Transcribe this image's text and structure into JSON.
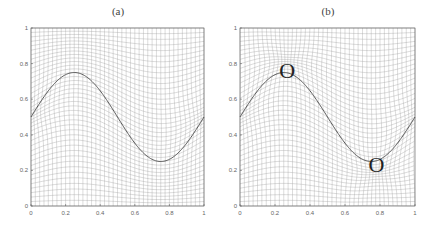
{
  "figure": {
    "panels": [
      {
        "id": "a",
        "title": "(a)"
      },
      {
        "id": "b",
        "title": "(b)"
      }
    ]
  },
  "chart_data": [
    {
      "type": "line",
      "title": "(a)",
      "description": "Adaptive mesh (deformed grid lines) with sine interface curve; mesh concentrated near (0,0.5) and (1,0.5)",
      "xlabel": "",
      "ylabel": "",
      "xlim": [
        0,
        1
      ],
      "ylim": [
        0,
        1
      ],
      "xticks": [
        "0",
        "0.2",
        "0.4",
        "0.6",
        "0.8",
        "1"
      ],
      "yticks": [
        "0",
        "0.2",
        "0.4",
        "0.6",
        "0.8",
        "1"
      ],
      "grid": false,
      "series": [
        {
          "name": "interface curve",
          "x": [
            0,
            0.1,
            0.2,
            0.25,
            0.3,
            0.4,
            0.5,
            0.6,
            0.7,
            0.75,
            0.8,
            0.9,
            1.0
          ],
          "y": [
            0.5,
            0.647,
            0.738,
            0.75,
            0.738,
            0.647,
            0.5,
            0.353,
            0.262,
            0.25,
            0.262,
            0.353,
            0.5
          ]
        }
      ],
      "mesh": {
        "lines": 40,
        "concentration_points": [
          [
            0,
            0.5
          ],
          [
            1,
            0.5
          ]
        ]
      },
      "annotations": []
    },
    {
      "type": "line",
      "title": "(b)",
      "description": "Adaptive mesh with sine interface curve; mesh concentrated near the curve extrema and at (0,0.5),(1,0.5)",
      "xlabel": "",
      "ylabel": "",
      "xlim": [
        0,
        1
      ],
      "ylim": [
        0,
        1
      ],
      "xticks": [
        "0",
        "0.2",
        "0.4",
        "0.6",
        "0.8",
        "1"
      ],
      "yticks": [
        "0",
        "0.2",
        "0.4",
        "0.6",
        "0.8",
        "1"
      ],
      "grid": false,
      "series": [
        {
          "name": "interface curve",
          "x": [
            0,
            0.1,
            0.2,
            0.25,
            0.3,
            0.4,
            0.5,
            0.6,
            0.7,
            0.75,
            0.8,
            0.9,
            1.0
          ],
          "y": [
            0.5,
            0.647,
            0.738,
            0.75,
            0.738,
            0.647,
            0.5,
            0.353,
            0.262,
            0.25,
            0.262,
            0.353,
            0.5
          ]
        }
      ],
      "mesh": {
        "lines": 40,
        "concentration_points": [
          [
            0.27,
            0.75
          ],
          [
            0.78,
            0.25
          ],
          [
            0,
            0.5
          ],
          [
            1,
            0.5
          ]
        ]
      },
      "annotations": [
        {
          "text": "O",
          "x": 0.27,
          "y": 0.76
        },
        {
          "text": "O",
          "x": 0.78,
          "y": 0.23
        }
      ]
    }
  ],
  "layout": {
    "panels": [
      {
        "left": 31,
        "right": 204,
        "top": 28,
        "bottom": 206,
        "title_x": 118,
        "title_y": 15
      },
      {
        "left": 240,
        "right": 415,
        "top": 28,
        "bottom": 206,
        "title_x": 328,
        "title_y": 15
      }
    ],
    "colors": {
      "mesh": "#9a9a9a",
      "curve": "#555555",
      "axis": "#555555",
      "text": "#444444"
    }
  }
}
